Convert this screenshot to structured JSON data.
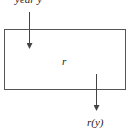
{
  "diagram": {
    "input_label": "year y",
    "box_label": "r",
    "output_label": "r(y)",
    "colors": {
      "stroke": "#444444",
      "text": "#222222",
      "background": "#ffffff"
    }
  }
}
